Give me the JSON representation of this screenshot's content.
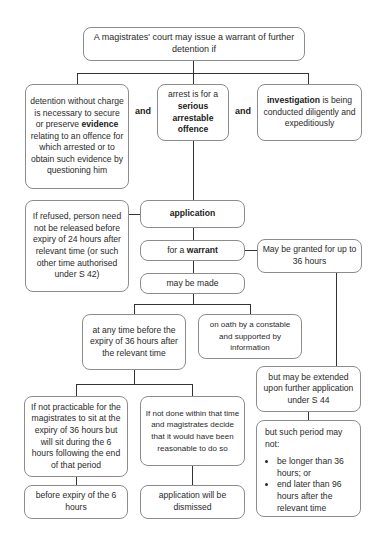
{
  "diagram": {
    "root": {
      "text": "A magistrates' court may issue a warrant of further detention if"
    },
    "conditions": [
      {
        "pre": "detention without charge is necessary to secure or preserve ",
        "bold": "evidence",
        "post": " relating to an offence for which arrested or to obtain such evidence by questioning him"
      },
      {
        "pre": "arrest is for a ",
        "bold": "serious arrestable offence",
        "post": ""
      },
      {
        "pre": "",
        "bold": "investigation",
        "post": " is being conducted diligently and expeditiously"
      }
    ],
    "connector_and": "and",
    "application": "application",
    "refused": "If refused, person need not be released before expiry of 24 hours after relevant time (or such other time authorised under S 42)",
    "warrant": {
      "pre": "for a ",
      "bold": "warrant"
    },
    "granted": "May be granted for up to 36 hours",
    "may_be_made": "may be made",
    "timing": "at any time before the expiry of 36 hours after the relevant time",
    "oath": "on oath by a constable and supported by information",
    "not_practicable": "If not practicable for the magistrates to sit at the expiry of 36 hours but will sit during the 6 hours following the end of that period",
    "not_done": "If not done within that time and magistrates decide that it would have been reasonable to do so",
    "before_expiry": "before expiry of the 6 hours",
    "dismissed": "application will be dismissed",
    "extended": "but may be extended upon further application under S 44",
    "limits": {
      "intro": "but such period may not:",
      "bullets": [
        "be longer than 36 hours; or",
        "end later than 96 hours after the relevant time"
      ]
    }
  }
}
